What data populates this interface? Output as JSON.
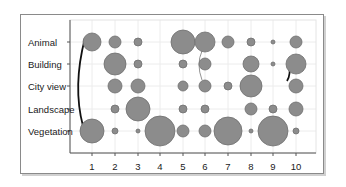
{
  "chart_data": {
    "type": "bubble",
    "title": "",
    "xlabel": "",
    "ylabel": "",
    "categories_x": [
      "1",
      "2",
      "3",
      "4",
      "5",
      "6",
      "7",
      "8",
      "9",
      "10"
    ],
    "categories_y": [
      "Animal",
      "Building",
      "City view",
      "Landscape",
      "Vegetation"
    ],
    "grid": true,
    "legend": "none",
    "bubble_color": "#8c8c8c",
    "bubble_stroke": "#6e6e6e",
    "series": [
      {
        "name": "Animal",
        "sizes": [
          9,
          6,
          4,
          0,
          12,
          10,
          6,
          4,
          2,
          6
        ]
      },
      {
        "name": "Building",
        "sizes": [
          0,
          11,
          4,
          0,
          4,
          6,
          0,
          8,
          2,
          10
        ]
      },
      {
        "name": "City view",
        "sizes": [
          0,
          7,
          7,
          0,
          5,
          6,
          4,
          11,
          0,
          7
        ]
      },
      {
        "name": "Landscape",
        "sizes": [
          0,
          4,
          12,
          0,
          4,
          4,
          0,
          6,
          4,
          7
        ]
      },
      {
        "name": "Vegetation",
        "sizes": [
          12,
          3,
          2,
          15,
          6,
          6,
          14,
          2,
          15,
          3
        ]
      }
    ],
    "connectors": [
      {
        "from": {
          "x": "1",
          "y": "Animal"
        },
        "to": {
          "x": "1",
          "y": "Vegetation"
        },
        "style": "thick-black"
      },
      {
        "from": {
          "x": "6",
          "y": "Animal"
        },
        "to": {
          "x": "6",
          "y": "City view"
        },
        "style": "thin-gray"
      },
      {
        "from": {
          "x": "10",
          "y": "Building"
        },
        "to": {
          "x": "10",
          "y": "City view"
        },
        "style": "thick-black"
      }
    ]
  },
  "axis": {
    "y_labels": [
      "Animal",
      "Building",
      "City view",
      "Landscape",
      "Vegetation"
    ],
    "x_labels": [
      "1",
      "2",
      "3",
      "4",
      "5",
      "6",
      "7",
      "8",
      "9",
      "10"
    ]
  }
}
